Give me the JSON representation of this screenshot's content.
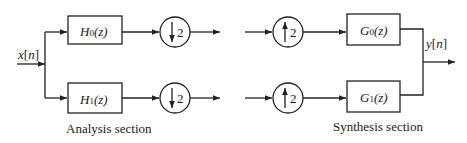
{
  "diagram": {
    "input_label": "x[n]",
    "input_var": "x",
    "input_index": "n",
    "output_label": "y[n]",
    "output_var": "y",
    "output_index": "n",
    "analysis": {
      "caption": "Analysis section",
      "filters": [
        {
          "name": "H",
          "sub": "0",
          "arg": "(z)",
          "full": "H0(z)"
        },
        {
          "name": "H",
          "sub": "1",
          "arg": "(z)",
          "full": "H1(z)"
        }
      ],
      "decimators": [
        {
          "direction": "down",
          "factor": "2"
        },
        {
          "direction": "down",
          "factor": "2"
        }
      ]
    },
    "synthesis": {
      "caption": "Synthesis section",
      "expanders": [
        {
          "direction": "up",
          "factor": "2"
        },
        {
          "direction": "up",
          "factor": "2"
        }
      ],
      "filters": [
        {
          "name": "G",
          "sub": "0",
          "arg": "(z)",
          "full": "G0(z)"
        },
        {
          "name": "G",
          "sub": "1",
          "arg": "(z)",
          "full": "G1(z)"
        }
      ]
    },
    "colors": {
      "stroke": "#222222",
      "background": "#ffffff"
    }
  }
}
